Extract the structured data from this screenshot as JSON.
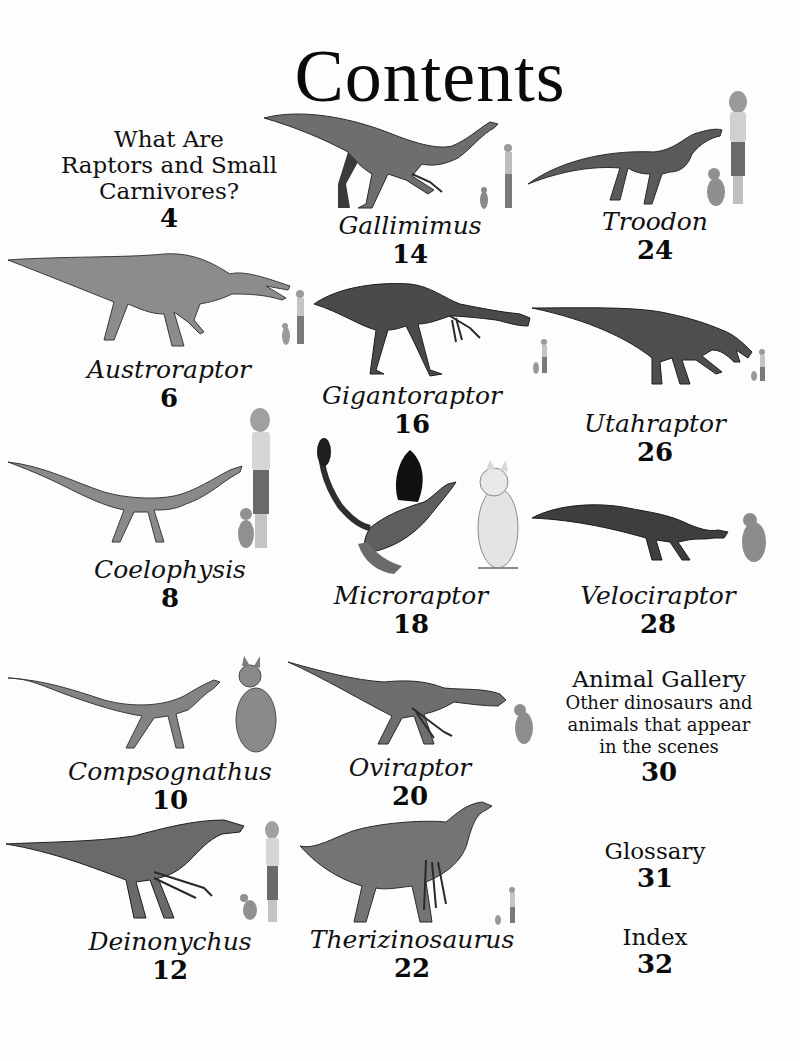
{
  "page": {
    "title": "Contents"
  },
  "entries": [
    {
      "id": "intro",
      "title_lines": [
        "What Are",
        "Raptors and Small",
        "Carnivores?"
      ],
      "page": "4"
    },
    {
      "id": "austroraptor",
      "name": "Austroraptor",
      "page": "6"
    },
    {
      "id": "coelophysis",
      "name": "Coelophysis",
      "page": "8"
    },
    {
      "id": "compsognathus",
      "name": "Compsognathus",
      "page": "10"
    },
    {
      "id": "deinonychus",
      "name": "Deinonychus",
      "page": "12"
    },
    {
      "id": "gallimimus",
      "name": "Gallimimus",
      "page": "14"
    },
    {
      "id": "gigantoraptor",
      "name": "Gigantoraptor",
      "page": "16"
    },
    {
      "id": "microraptor",
      "name": "Microraptor",
      "page": "18"
    },
    {
      "id": "oviraptor",
      "name": "Oviraptor",
      "page": "20"
    },
    {
      "id": "therizinosaurus",
      "name": "Therizinosaurus",
      "page": "22"
    },
    {
      "id": "troodon",
      "name": "Troodon",
      "page": "24"
    },
    {
      "id": "utahraptor",
      "name": "Utahraptor",
      "page": "26"
    },
    {
      "id": "velociraptor",
      "name": "Velociraptor",
      "page": "28"
    },
    {
      "id": "animal-gallery",
      "title": "Animal Gallery",
      "description_lines": [
        "Other dinosaurs and",
        "animals that appear",
        "in the scenes"
      ],
      "page": "30"
    },
    {
      "id": "glossary",
      "title": "Glossary",
      "page": "31"
    },
    {
      "id": "index",
      "title": "Index",
      "page": "32"
    }
  ],
  "illustrations": {
    "gallimimus": "gallimimus with girl and cat for scale",
    "troodon": "troodon with girl and cat for scale",
    "austroraptor": "austroraptor with girl and cat for scale",
    "gigantoraptor": "gigantoraptor with girl and cat for scale",
    "utahraptor": "utahraptor with girl and cat for scale",
    "coelophysis": "coelophysis with girl and cat for scale",
    "microraptor": "microraptor with cat for scale",
    "velociraptor": "velociraptor with cat for scale",
    "compsognathus": "compsognathus with cat for scale",
    "oviraptor": "oviraptor with cat for scale",
    "deinonychus": "deinonychus with girl and cat for scale",
    "therizinosaurus": "therizinosaurus with girl and cat for scale"
  },
  "colors": {
    "text": "#111111",
    "background": "#fdfdfd",
    "dino_dark": "#3a3a3a",
    "dino_mid": "#7a7a7a",
    "dino_light": "#b0b0b0"
  }
}
